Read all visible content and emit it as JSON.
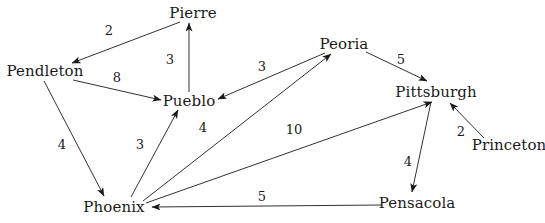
{
  "figure": {
    "title": "",
    "background_color": "#ffffff",
    "line_color": "#1a1a1a",
    "text_color": "#1a1a1a"
  },
  "chart_data": {
    "type": "diagram",
    "diagram_kind": "directed-weighted-graph",
    "title": "",
    "nodes": [
      {
        "id": "pierre",
        "label": "Pierre",
        "x": 193,
        "y": 13
      },
      {
        "id": "pendleton",
        "label": "Pendleton",
        "x": 45,
        "y": 71
      },
      {
        "id": "pueblo",
        "label": "Pueblo",
        "x": 189,
        "y": 101
      },
      {
        "id": "peoria",
        "label": "Peoria",
        "x": 344,
        "y": 44
      },
      {
        "id": "pittsburgh",
        "label": "Pittsburgh",
        "x": 436,
        "y": 92
      },
      {
        "id": "princeton",
        "label": "Princeton",
        "x": 509,
        "y": 145
      },
      {
        "id": "phoenix",
        "label": "Phoenix",
        "x": 114,
        "y": 207
      },
      {
        "id": "pensacola",
        "label": "Pensacola",
        "x": 417,
        "y": 203
      }
    ],
    "edges": [
      {
        "from": "pierre",
        "to": "pendleton",
        "weight": 2,
        "label_x": 109,
        "label_y": 30
      },
      {
        "from": "pueblo",
        "to": "pierre",
        "weight": 3,
        "label_x": 170,
        "label_y": 59
      },
      {
        "from": "pendleton",
        "to": "pueblo",
        "weight": 8,
        "label_x": 117,
        "label_y": 77
      },
      {
        "from": "peoria",
        "to": "pueblo",
        "weight": 3,
        "label_x": 262,
        "label_y": 66
      },
      {
        "from": "peoria",
        "to": "pittsburgh",
        "weight": 5,
        "label_x": 401,
        "label_y": 59
      },
      {
        "from": "princeton",
        "to": "pittsburgh",
        "weight": 2,
        "label_x": 461,
        "label_y": 131
      },
      {
        "from": "pendleton",
        "to": "phoenix",
        "weight": 4,
        "label_x": 62,
        "label_y": 144
      },
      {
        "from": "phoenix",
        "to": "pueblo",
        "weight": 3,
        "label_x": 140,
        "label_y": 144
      },
      {
        "from": "phoenix",
        "to": "peoria",
        "weight": 4,
        "label_x": 203,
        "label_y": 127
      },
      {
        "from": "phoenix",
        "to": "pittsburgh",
        "weight": 10,
        "label_x": 294,
        "label_y": 129
      },
      {
        "from": "pittsburgh",
        "to": "pensacola",
        "weight": 4,
        "label_x": 408,
        "label_y": 161
      },
      {
        "from": "pensacola",
        "to": "phoenix",
        "weight": 5,
        "label_x": 262,
        "label_y": 196
      }
    ],
    "edge_geometry": [
      {
        "id": "pierre-pendleton",
        "x1": 180,
        "y1": 22,
        "x2": 72,
        "y2": 63
      },
      {
        "id": "pueblo-pierre",
        "x1": 189,
        "y1": 92,
        "x2": 189,
        "y2": 23
      },
      {
        "id": "pendleton-pueblo",
        "x1": 73,
        "y1": 80,
        "x2": 161,
        "y2": 100
      },
      {
        "id": "peoria-pueblo",
        "x1": 325,
        "y1": 53,
        "x2": 218,
        "y2": 99
      },
      {
        "id": "peoria-pittsburgh",
        "x1": 366,
        "y1": 52,
        "x2": 427,
        "y2": 81
      },
      {
        "id": "princeton-pittsburgh",
        "x1": 484,
        "y1": 138,
        "x2": 450,
        "y2": 103
      },
      {
        "id": "pendleton-phoenix",
        "x1": 44,
        "y1": 81,
        "x2": 104,
        "y2": 196
      },
      {
        "id": "phoenix-pueblo",
        "x1": 131,
        "y1": 197,
        "x2": 178,
        "y2": 110
      },
      {
        "id": "phoenix-peoria",
        "x1": 143,
        "y1": 201,
        "x2": 331,
        "y2": 54
      },
      {
        "id": "phoenix-pittsburgh",
        "x1": 146,
        "y1": 203,
        "x2": 432,
        "y2": 102
      },
      {
        "id": "pittsburgh-pensacola",
        "x1": 431,
        "y1": 102,
        "x2": 412,
        "y2": 192
      },
      {
        "id": "pensacola-phoenix",
        "x1": 382,
        "y1": 205,
        "x2": 152,
        "y2": 207
      }
    ],
    "node_count": 8,
    "edge_count": 12,
    "total_weight": 53
  }
}
